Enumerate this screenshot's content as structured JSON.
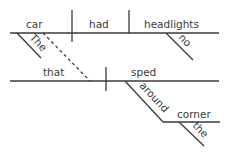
{
  "diagram": {
    "type": "sentence-diagram",
    "main_clause": {
      "subject": "car",
      "verb": "had",
      "object": "headlights",
      "subject_modifier": "The",
      "object_modifier": "no"
    },
    "relative_clause": {
      "subject": "that",
      "verb": "sped",
      "preposition": "around",
      "prep_object": "corner",
      "prep_object_modifier": "the"
    },
    "colors": {
      "line": "#3a3a3a",
      "text": "#3a3a3a",
      "background": "#ffffff"
    }
  }
}
